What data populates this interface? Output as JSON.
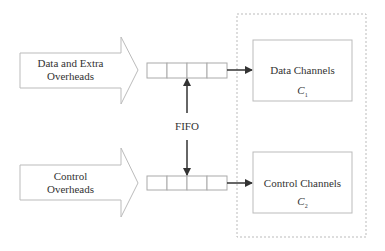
{
  "diagram": {
    "inputs": [
      {
        "label_line1": "Data and Extra",
        "label_line2": "Overheads"
      },
      {
        "label_line1": "Control",
        "label_line2": "Overheads"
      }
    ],
    "fifo_label": "FIFO",
    "fifo_cells": 4,
    "channels": [
      {
        "label": "Data Channels",
        "symbol": "C",
        "subscript": "1"
      },
      {
        "label": "Control Channels",
        "symbol": "C",
        "subscript": "2"
      }
    ],
    "colors": {
      "stroke": "#bbbbbb",
      "arrow": "#333333",
      "dashed": "#bbbbbb"
    }
  }
}
